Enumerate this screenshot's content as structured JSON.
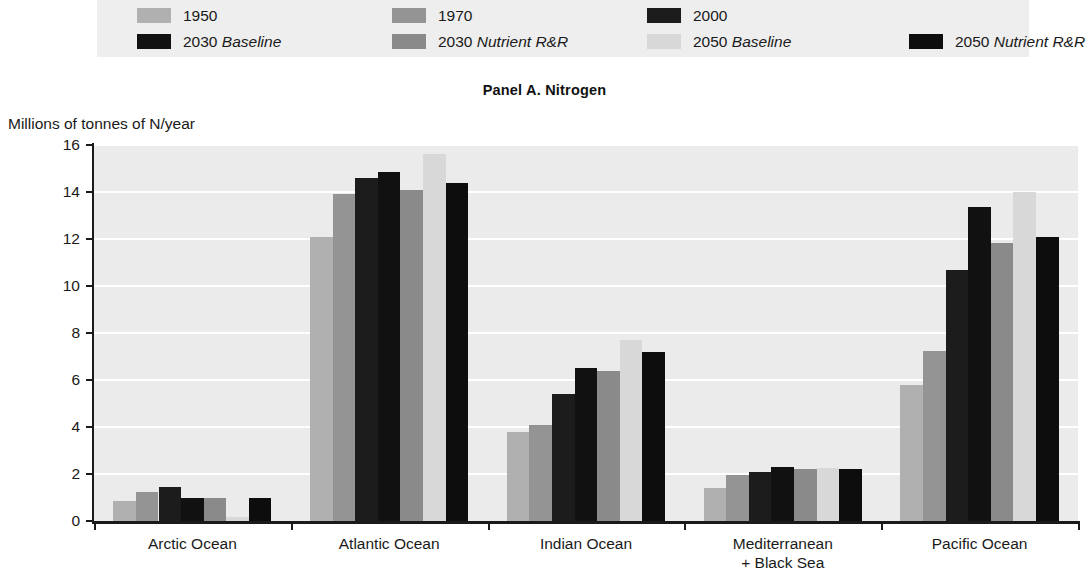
{
  "panel": {
    "title": "Panel A. Nitrogen",
    "y_axis_title": "Millions of tonnes of N/year"
  },
  "legend": {
    "background": "#eeeeee",
    "items": [
      {
        "label": "1950",
        "italic_part": "",
        "color": "#b0b0b0",
        "row": 0,
        "col": 0
      },
      {
        "label": "1970",
        "italic_part": "",
        "color": "#949494",
        "row": 0,
        "col": 1
      },
      {
        "label": "2000",
        "italic_part": "",
        "color": "#1c1c1c",
        "row": 0,
        "col": 2
      },
      {
        "label": "2030",
        "italic_part": "Baseline",
        "color": "#111111",
        "row": 1,
        "col": 0
      },
      {
        "label": "2030",
        "italic_part": "Nutrient R&R",
        "color": "#8a8a8a",
        "row": 1,
        "col": 1
      },
      {
        "label": "2050",
        "italic_part": "Baseline",
        "color": "#d8d8d8",
        "row": 1,
        "col": 2
      },
      {
        "label": "2050",
        "italic_part": "Nutrient R&R",
        "color": "#0d0d0d",
        "row": 1,
        "col": 3
      }
    ]
  },
  "chart_data": {
    "type": "bar",
    "title": "Panel A. Nitrogen",
    "subtitle": "",
    "xlabel": "",
    "ylabel": "Millions of tonnes of N/year",
    "ylim": [
      0,
      16
    ],
    "yticks": [
      0,
      2,
      4,
      6,
      8,
      10,
      12,
      14,
      16
    ],
    "grid": true,
    "legend_position": "top",
    "categories": [
      "Arctic Ocean",
      "Atlantic Ocean",
      "Indian Ocean",
      "Mediterranean + Black Sea",
      "Pacific Ocean"
    ],
    "category_labels": [
      {
        "line1": "Arctic Ocean",
        "line2": ""
      },
      {
        "line1": "Atlantic Ocean",
        "line2": ""
      },
      {
        "line1": "Indian Ocean",
        "line2": ""
      },
      {
        "line1": "Mediterranean",
        "line2": "+ Black Sea"
      },
      {
        "line1": "Pacific Ocean",
        "line2": ""
      }
    ],
    "series": [
      {
        "name": "1950",
        "color": "#b0b0b0",
        "values": [
          0.85,
          12.1,
          3.8,
          1.4,
          5.8
        ]
      },
      {
        "name": "1970",
        "color": "#949494",
        "values": [
          1.25,
          13.9,
          4.1,
          1.95,
          7.25
        ]
      },
      {
        "name": "2000",
        "color": "#1c1c1c",
        "values": [
          1.45,
          14.6,
          5.4,
          2.1,
          10.7
        ]
      },
      {
        "name": "2030 Baseline",
        "color": "#111111",
        "values": [
          1.0,
          14.85,
          6.5,
          2.3,
          13.35
        ]
      },
      {
        "name": "2030 Nutrient R&R",
        "color": "#8a8a8a",
        "values": [
          1.0,
          14.1,
          6.4,
          2.2,
          11.85
        ]
      },
      {
        "name": "2050 Baseline",
        "color": "#d8d8d8",
        "values": [
          0.15,
          15.6,
          7.7,
          2.25,
          14.0
        ]
      },
      {
        "name": "2050 Nutrient R&R",
        "color": "#0d0d0d",
        "values": [
          1.0,
          14.4,
          7.2,
          2.2,
          12.1
        ]
      }
    ]
  }
}
